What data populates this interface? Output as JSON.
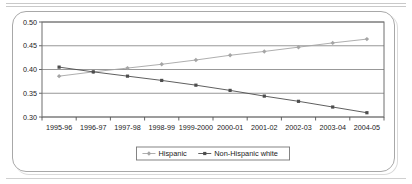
{
  "figure": {
    "frame_color": "#a8a8a8",
    "background": "#ffffff"
  },
  "chart_data": {
    "type": "line",
    "title": "",
    "subtitle": "",
    "xlabel": "",
    "ylabel": "",
    "categories": [
      "1995-96",
      "1996-97",
      "1997-98",
      "1998-99",
      "1999-2000",
      "2000-01",
      "2001-02",
      "2002-03",
      "2003-04",
      "2004-05"
    ],
    "series": [
      {
        "name": "Hispanic",
        "color": "#a5a5a5",
        "marker": "diamond",
        "values": [
          0.386,
          0.395,
          0.403,
          0.411,
          0.42,
          0.43,
          0.438,
          0.447,
          0.456,
          0.464
        ]
      },
      {
        "name": "Non-Hispanic white",
        "color": "#4d4d4d",
        "marker": "square",
        "values": [
          0.405,
          0.395,
          0.386,
          0.377,
          0.367,
          0.356,
          0.344,
          0.333,
          0.321,
          0.309
        ]
      }
    ],
    "ylim": [
      0.3,
      0.5
    ],
    "yticks": [
      0.3,
      0.35,
      0.4,
      0.45,
      0.5
    ],
    "ytick_labels": [
      "0.30",
      "0.35",
      "0.40",
      "0.45",
      "0.50"
    ],
    "grid": true,
    "grid_axis": "y",
    "grid_color": "#8c8c8c",
    "legend_position": "bottom",
    "legend": [
      "Hispanic",
      "Non-Hispanic white"
    ]
  }
}
